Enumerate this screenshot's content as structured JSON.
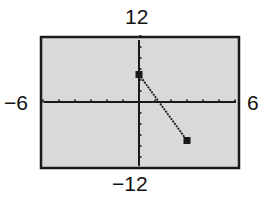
{
  "window": {
    "xmin_label": "−6",
    "xmax_label": "6",
    "ymax_label": "12",
    "ymin_label": "−12"
  },
  "colors": {
    "screen_bg": "#d9d9d9",
    "frame": "#1a1a1a",
    "axis": "#1a1a1a",
    "line": "#1a1a1a"
  },
  "chart_data": {
    "type": "line",
    "title": "",
    "xlabel": "",
    "ylabel": "",
    "xlim": [
      -6,
      6
    ],
    "ylim": [
      -12,
      12
    ],
    "xscale_tick": 1,
    "yscale_tick": 2,
    "grid": false,
    "tick_labels": {
      "x": [
        "−6",
        "6"
      ],
      "y": [
        "−12",
        "12"
      ]
    },
    "series": [
      {
        "name": "graph",
        "x": [
          0,
          3
        ],
        "y": [
          5,
          -7
        ],
        "markers": "square endpoints",
        "equation_estimate": "y = 5 - 4x, 0 ≤ x ≤ 3"
      }
    ]
  }
}
